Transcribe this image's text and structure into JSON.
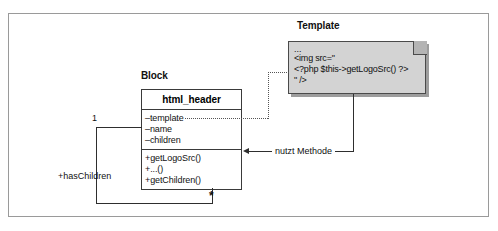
{
  "diagram": {
    "title_block": "Block",
    "title_template": "Template",
    "class": {
      "name": "html_header",
      "attributes": [
        "–template",
        "–name",
        "–children"
      ],
      "operations": [
        "+getLogoSrc()",
        "+...()",
        "+getChildren()"
      ]
    },
    "note": {
      "lines": [
        "...",
        "<img src=\"",
        "<?php $this->getLogoSrc() ?>",
        "\" />"
      ]
    },
    "associations": {
      "uses_method_label": "nutzt Methode",
      "has_children_label": "+hasChildren",
      "multiplicity_one": "1",
      "multiplicity_many": "*"
    },
    "colors": {
      "note_fill": "#d3d3d3",
      "note_fold": "#b4b4b4",
      "note_shadow": "#9d9d9d",
      "line": "#2e2e2e",
      "frame": "#9a9a9a",
      "class_border": "#3a3a3a"
    }
  }
}
